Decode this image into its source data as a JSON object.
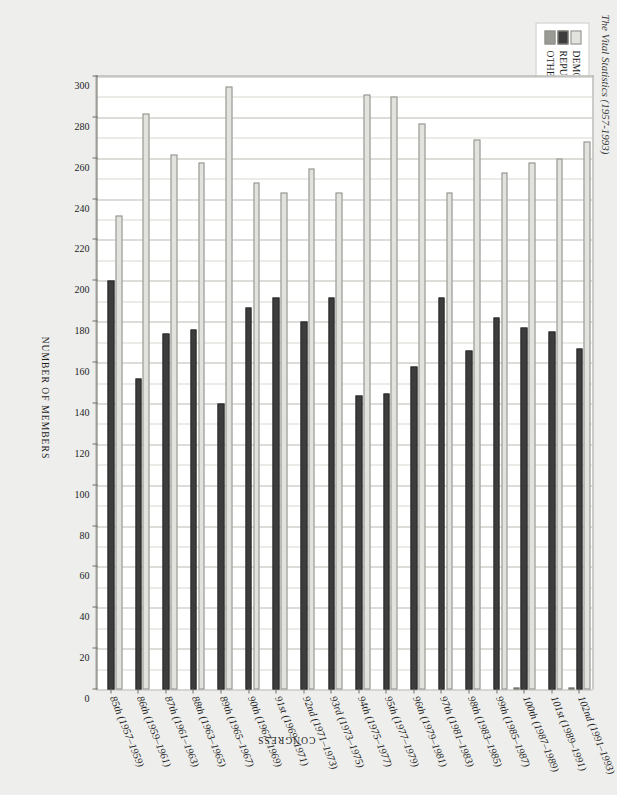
{
  "title": "The Vital Statistics (1957-1993)",
  "legend": {
    "position": "top-left",
    "items": [
      {
        "label": "DEMOCRATS",
        "color": "#e2e2de"
      },
      {
        "label": "REPUBLICANS",
        "color": "#3d3d3d"
      },
      {
        "label": "OTHER",
        "color": "#9a9a95"
      }
    ]
  },
  "axes": {
    "value_axis_title": "NUMBER OF MEMBERS",
    "category_axis_title": "CONGRESS",
    "value_ticks": [
      0,
      20,
      40,
      60,
      80,
      100,
      120,
      140,
      160,
      180,
      200,
      220,
      240,
      260,
      280,
      300
    ],
    "value_min": 0,
    "value_max": 300,
    "minor_step": 10
  },
  "chart_data": {
    "type": "bar",
    "orientation": "horizontal",
    "title": "The Vital Statistics (1957-1993)",
    "xlabel": "NUMBER OF MEMBERS",
    "ylabel": "CONGRESS",
    "xlim": [
      0,
      300
    ],
    "grid": true,
    "legend_position": "top-left",
    "categories": [
      "85th (1957-1959)",
      "86th (1959-1961)",
      "87th (1961-1963)",
      "88th (1963-1965)",
      "89th (1965-1967)",
      "90th (1967-1969)",
      "91st (1969-1971)",
      "92nd (1971-1973)",
      "93rd (1973-1975)",
      "94th (1975-1977)",
      "95th (1977-1979)",
      "96th (1979-1981)",
      "97th (1981-1983)",
      "98th (1983-1985)",
      "99th (1985-1987)",
      "100th (1987-1989)",
      "101st (1989-1991)",
      "102nd (1991-1993)"
    ],
    "series": [
      {
        "name": "DEMOCRATS",
        "color": "#e2e2de",
        "values": [
          232,
          282,
          262,
          258,
          295,
          248,
          243,
          255,
          243,
          291,
          290,
          277,
          243,
          269,
          253,
          258,
          260,
          268
        ]
      },
      {
        "name": "REPUBLICANS",
        "color": "#3d3d3d",
        "values": [
          200,
          152,
          174,
          176,
          140,
          187,
          192,
          180,
          192,
          144,
          145,
          158,
          192,
          166,
          182,
          177,
          175,
          167
        ]
      },
      {
        "name": "OTHER",
        "color": "#9a9a95",
        "values": [
          0,
          0,
          0,
          0,
          0,
          0,
          0,
          0,
          0,
          0,
          0,
          0,
          0,
          0,
          0,
          1,
          0,
          1
        ]
      }
    ]
  }
}
